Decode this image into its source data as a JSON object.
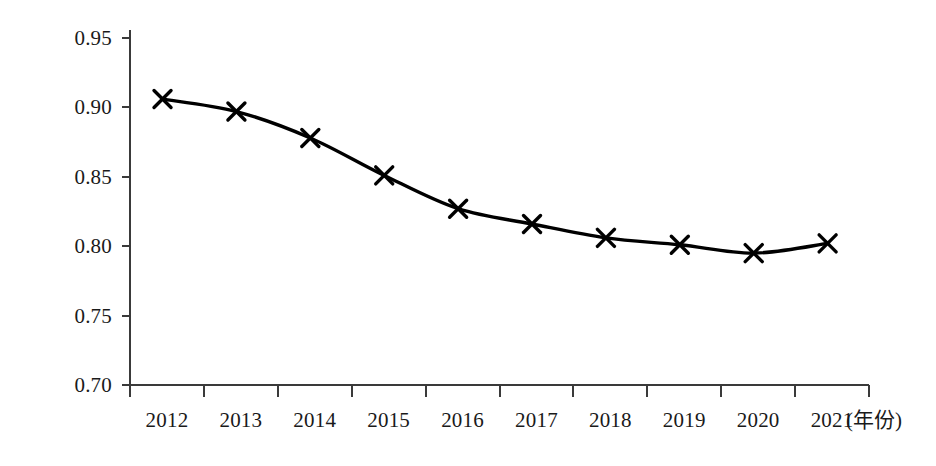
{
  "chart_data": {
    "type": "line",
    "title": "",
    "xlabel": "(年份)",
    "ylabel": "",
    "categories": [
      "2012",
      "2013",
      "2014",
      "2015",
      "2016",
      "2017",
      "2018",
      "2019",
      "2020",
      "2021"
    ],
    "values": [
      0.906,
      0.897,
      0.878,
      0.851,
      0.827,
      0.816,
      0.806,
      0.801,
      0.795,
      0.802
    ],
    "series": [
      {
        "name": "series-1",
        "values": [
          0.906,
          0.897,
          0.878,
          0.851,
          0.827,
          0.816,
          0.806,
          0.801,
          0.795,
          0.802
        ]
      }
    ],
    "ylim": [
      0.7,
      0.95
    ],
    "yticks": [
      "0.95",
      "0.90",
      "0.85",
      "0.80",
      "0.75",
      "0.70"
    ],
    "ytick_values": [
      0.95,
      0.9,
      0.85,
      0.8,
      0.75,
      0.7
    ],
    "grid": false,
    "legend": "none",
    "marker": "x-marker",
    "line_color": "#000000",
    "marker_color": "#000000",
    "axis_color": "#3a3a3a"
  }
}
